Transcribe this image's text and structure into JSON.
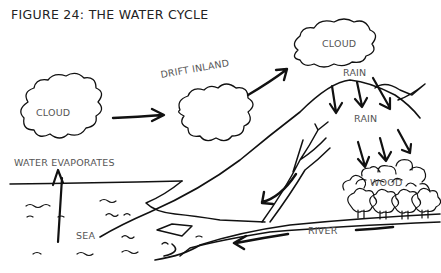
{
  "figure": {
    "title": "FIGURE 24: THE WATER CYCLE"
  },
  "labels": {
    "cloud_left": "CLOUD",
    "drift_inland": "DRIFT INLAND",
    "cloud_right": "CLOUD",
    "rain_top": "RAIN",
    "rain_middle": "RAIN",
    "water_evaporates": "WATER EVAPORATES",
    "wood": "WOOD",
    "sea": "SEA",
    "river": "RIVER"
  },
  "colors": {
    "ink": "#111111",
    "label_text": "#555555",
    "background": "#ffffff"
  }
}
